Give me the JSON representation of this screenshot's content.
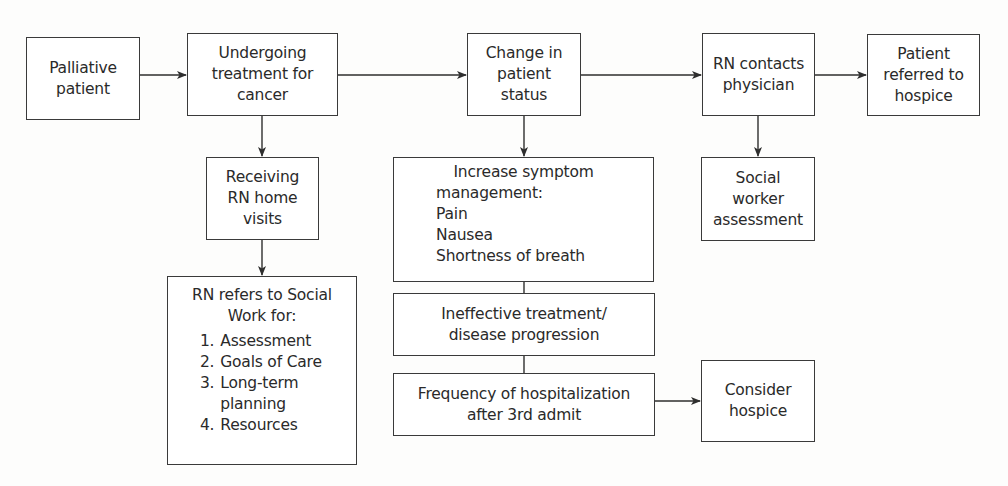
{
  "diagram": {
    "type": "flowchart",
    "nodes": {
      "palliative": {
        "lines": [
          "Palliative",
          "patient"
        ]
      },
      "undergoing": {
        "lines": [
          "Undergoing",
          "treatment for",
          "cancer"
        ]
      },
      "change": {
        "lines": [
          "Change in",
          "patient",
          "status"
        ]
      },
      "rn_contacts": {
        "lines": [
          "RN contacts",
          "physician"
        ]
      },
      "referred": {
        "lines": [
          "Patient",
          "referred to",
          "hospice"
        ]
      },
      "receiving": {
        "lines": [
          "Receiving",
          "RN home",
          "visits"
        ]
      },
      "social_work": {
        "header_lines": [
          "RN refers to Social",
          "Work for:"
        ],
        "items": [
          {
            "num": "1.",
            "text": "Assessment"
          },
          {
            "num": "2.",
            "text": "Goals of Care"
          },
          {
            "num": "3.",
            "text": "Long-term",
            "cont": "planning"
          },
          {
            "num": "4.",
            "text": "Resources"
          }
        ]
      },
      "symptom": {
        "header_lines": [
          "Increase symptom",
          "management:"
        ],
        "items": [
          "Pain",
          "Nausea",
          "Shortness of breath"
        ]
      },
      "ineffective": {
        "lines": [
          "Ineffective treatment/",
          "disease progression"
        ]
      },
      "frequency": {
        "lines": [
          "Frequency of hospitalization",
          "after 3rd admit"
        ]
      },
      "social_worker": {
        "lines": [
          "Social",
          "worker",
          "assessment"
        ]
      },
      "consider": {
        "lines": [
          "Consider",
          "hospice"
        ]
      }
    },
    "edges": [
      {
        "from": "palliative",
        "to": "undergoing",
        "arrow": true
      },
      {
        "from": "undergoing",
        "to": "change",
        "arrow": true
      },
      {
        "from": "change",
        "to": "rn_contacts",
        "arrow": true
      },
      {
        "from": "rn_contacts",
        "to": "referred",
        "arrow": true
      },
      {
        "from": "undergoing",
        "to": "receiving",
        "arrow": true
      },
      {
        "from": "receiving",
        "to": "social_work",
        "arrow": true
      },
      {
        "from": "change",
        "to": "symptom",
        "arrow": true
      },
      {
        "from": "symptom",
        "to": "ineffective",
        "arrow": false
      },
      {
        "from": "ineffective",
        "to": "frequency",
        "arrow": false
      },
      {
        "from": "rn_contacts",
        "to": "social_worker",
        "arrow": true
      },
      {
        "from": "frequency",
        "to": "consider",
        "arrow": true
      }
    ],
    "colors": {
      "line": "#2e2e2e",
      "box_border": "#3a3a3a",
      "text": "#2a2a2a",
      "background": "#fdfdfc"
    }
  }
}
